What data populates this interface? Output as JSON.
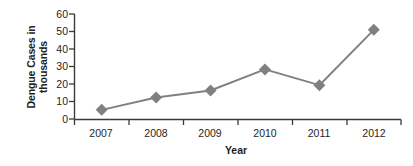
{
  "chart_data": {
    "type": "line",
    "title": "",
    "xlabel": "Year",
    "ylabel": "Dengue Cases in thousands",
    "ylabel_line1": "Dengue Cases in",
    "ylabel_line2": "thousands",
    "categories": [
      "2007",
      "2008",
      "2009",
      "2010",
      "2011",
      "2012"
    ],
    "values": [
      5.5,
      12.5,
      16.5,
      28.5,
      19.5,
      51
    ],
    "ylim": [
      0,
      60
    ],
    "yticks": [
      0,
      10,
      20,
      30,
      40,
      50,
      60
    ],
    "ytick_labels": [
      "0",
      "10",
      "20",
      "30",
      "40",
      "50",
      "60"
    ],
    "grid": false,
    "legend": false,
    "marker": "diamond",
    "series_color": "#808080",
    "axis_color": "#3a3a3a",
    "text_color": "#231f20"
  }
}
